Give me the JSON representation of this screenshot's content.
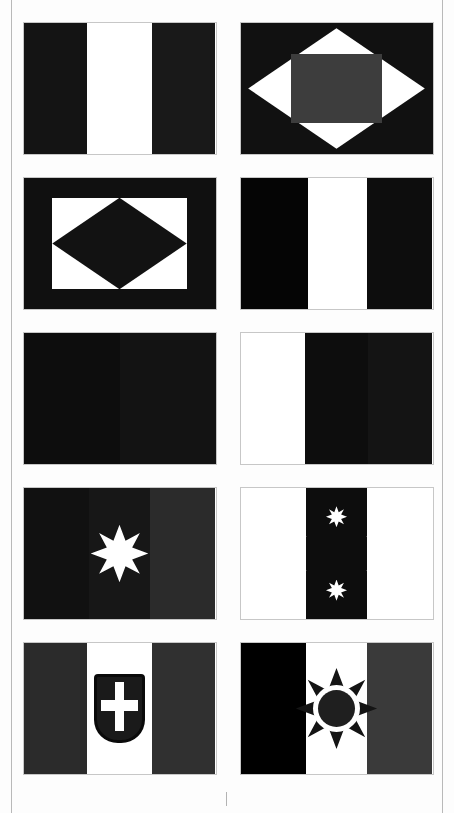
{
  "page": {
    "background": "#fdfdfd",
    "rule_color": "#b9b9b9",
    "columns": 2,
    "rows": 5,
    "total_flags": 10
  },
  "palette": {
    "black": "#0a0a0a",
    "near_black": "#111111",
    "dark_1": "#161616",
    "dark_2": "#1d1d1d",
    "dark_3": "#242424",
    "dark_gray": "#2e2e2e",
    "mid_gray": "#3a3a3a",
    "gray": "#474747",
    "white": "#ffffff",
    "border": "#c7c7c7"
  },
  "flags": [
    {
      "id": "flag-1",
      "position": "row1-left",
      "layout": "vertical-triband",
      "name": "vertical-triband-dark-white-dark",
      "stripes": [
        {
          "name": "hoist-stripe",
          "color": "#141414",
          "width_pct": 33.3
        },
        {
          "name": "middle-stripe",
          "color": "#ffffff",
          "width_pct": 33.4
        },
        {
          "name": "fly-stripe",
          "color": "#191919",
          "width_pct": 33.3
        }
      ],
      "emblem": null
    },
    {
      "id": "flag-2",
      "position": "row1-right",
      "layout": "lozenge-with-rectangle",
      "name": "dark-field-white-lozenge-gray-rectangle",
      "field_color": "#111111",
      "lozenge": {
        "name": "white-lozenge",
        "color": "#ffffff",
        "width_pct": 92,
        "height_pct": 92
      },
      "inner": {
        "name": "gray-rectangle",
        "color": "#3d3d3d",
        "width_pct": 47,
        "height_pct": 52
      }
    },
    {
      "id": "flag-3",
      "position": "row2-left",
      "layout": "bordered-lozenge",
      "name": "dark-border-white-field-dark-lozenge",
      "border_color": "#101010",
      "field_color": "#ffffff",
      "border_width_pct": 15,
      "lozenge": {
        "name": "dark-lozenge",
        "color": "#121212",
        "width_pct": 100,
        "height_pct": 100
      }
    },
    {
      "id": "flag-4",
      "position": "row2-right",
      "layout": "vertical-triband",
      "name": "vertical-triband-black-white-dark",
      "stripes": [
        {
          "name": "hoist-stripe",
          "color": "#050505",
          "width_pct": 35
        },
        {
          "name": "middle-stripe",
          "color": "#ffffff",
          "width_pct": 31
        },
        {
          "name": "fly-stripe",
          "color": "#0d0d0d",
          "width_pct": 34
        }
      ],
      "emblem": null
    },
    {
      "id": "flag-5",
      "position": "row3-left",
      "layout": "vertical-bicolor",
      "name": "vertical-bicolor-dark-dark",
      "stripes": [
        {
          "name": "hoist-stripe",
          "color": "#0d0d0d",
          "width_pct": 50
        },
        {
          "name": "fly-stripe",
          "color": "#131313",
          "width_pct": 50
        }
      ],
      "emblem": null
    },
    {
      "id": "flag-6",
      "position": "row3-right",
      "layout": "vertical-triband",
      "name": "vertical-triband-white-dark-dark",
      "stripes": [
        {
          "name": "hoist-stripe",
          "color": "#ffffff",
          "width_pct": 33.5
        },
        {
          "name": "middle-stripe",
          "color": "#0d0d0d",
          "width_pct": 33
        },
        {
          "name": "fly-stripe",
          "color": "#141414",
          "width_pct": 33.5
        }
      ],
      "emblem": null
    },
    {
      "id": "flag-7",
      "position": "row4-left",
      "layout": "vertical-triband-with-star",
      "name": "vertical-triband-dark-with-white-star",
      "stripes": [
        {
          "name": "hoist-stripe",
          "color": "#111111",
          "width_pct": 34
        },
        {
          "name": "middle-stripe",
          "color": "#171717",
          "width_pct": 32
        },
        {
          "name": "fly-stripe",
          "color": "#2b2b2b",
          "width_pct": 34
        }
      ],
      "emblem": {
        "name": "white-eight-pointed-star",
        "type": "star8",
        "color": "#ffffff",
        "count": 1,
        "size_pct": 30,
        "center_x_pct": 50,
        "center_y_pct": 50
      }
    },
    {
      "id": "flag-8",
      "position": "row4-right",
      "layout": "vertical-triband-with-stars",
      "name": "vertical-triband-white-dark-white-six-stars",
      "stripes": [
        {
          "name": "hoist-stripe",
          "color": "#ffffff",
          "width_pct": 34
        },
        {
          "name": "middle-stripe",
          "color": "#0d0d0d",
          "width_pct": 32
        },
        {
          "name": "fly-stripe",
          "color": "#ffffff",
          "width_pct": 34
        }
      ],
      "emblem": {
        "name": "six-white-eight-pointed-stars-ring",
        "type": "star8-ring",
        "color": "#ffffff",
        "count": 6,
        "star_size_pct": 11,
        "positions": [
          {
            "x_pct": 50,
            "y_pct": 22
          },
          {
            "x_pct": 29,
            "y_pct": 37
          },
          {
            "x_pct": 71,
            "y_pct": 37
          },
          {
            "x_pct": 29,
            "y_pct": 63
          },
          {
            "x_pct": 71,
            "y_pct": 63
          },
          {
            "x_pct": 50,
            "y_pct": 78
          }
        ]
      }
    },
    {
      "id": "flag-9",
      "position": "row5-left",
      "layout": "vertical-triband-with-shield",
      "name": "vertical-triband-with-crowned-shield-cross",
      "stripes": [
        {
          "name": "hoist-stripe",
          "color": "#2b2b2b",
          "width_pct": 33.3
        },
        {
          "name": "middle-stripe",
          "color": "#ffffff",
          "width_pct": 33.4
        },
        {
          "name": "fly-stripe",
          "color": "#303030",
          "width_pct": 33.3
        }
      ],
      "emblem": {
        "name": "shield-with-white-cross",
        "type": "shield",
        "field_color": "#1a1a1a",
        "border_color": "#0a0a0a",
        "cross_color": "#ffffff",
        "width_pct": 27,
        "height_pct": 52
      }
    },
    {
      "id": "flag-10",
      "position": "row5-right",
      "layout": "vertical-triband-with-sun",
      "name": "vertical-triband-black-white-gray-with-sun",
      "stripes": [
        {
          "name": "hoist-stripe",
          "color": "#000000",
          "width_pct": 34
        },
        {
          "name": "middle-stripe",
          "color": "#ffffff",
          "width_pct": 32
        },
        {
          "name": "fly-stripe",
          "color": "#3a3a3a",
          "width_pct": 34
        }
      ],
      "emblem": {
        "name": "eight-pointed-sun-with-ring",
        "type": "sun8",
        "ray_color": "#141414",
        "ring_color": "#ffffff",
        "disc_color": "#1f1f1f",
        "size_pct": 62,
        "ring_pct": 58,
        "disc_pct": 46
      }
    }
  ]
}
